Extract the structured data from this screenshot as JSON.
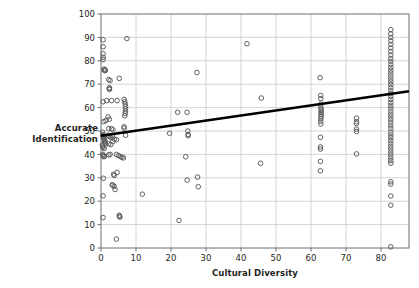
{
  "chart_data": {
    "type": "scatter",
    "title": "",
    "xlabel": "Cultural Diversity",
    "ylabel": "Accurate\nIdentification",
    "xlim": [
      0,
      88
    ],
    "ylim": [
      0,
      100
    ],
    "xticks": [
      0,
      10,
      20,
      30,
      40,
      50,
      60,
      70,
      80
    ],
    "yticks": [
      0,
      10,
      20,
      30,
      40,
      50,
      60,
      70,
      80,
      90,
      100
    ],
    "xtick_labels": [
      "0",
      "10",
      "20",
      "30",
      "40",
      "50",
      "60",
      "70",
      "80"
    ],
    "ytick_labels": [
      "0",
      "10",
      "20",
      "30",
      "40",
      "50",
      "60",
      "70",
      "80",
      "90",
      "100"
    ],
    "grid": true,
    "grid_color": "#c9c9c9",
    "legend": "none",
    "marker": "open-circle",
    "marker_edge_color": "#58595b",
    "marker_face_color": "none",
    "trendline": {
      "type": "linear",
      "color": "#000000",
      "width": 2.6,
      "x_start": 0,
      "y_start": 48,
      "x_end": 88,
      "y_end": 67
    },
    "points": [
      [
        0.6,
        89
      ],
      [
        0.6,
        86
      ],
      [
        0.6,
        83
      ],
      [
        0.6,
        81.5
      ],
      [
        0.6,
        80.5
      ],
      [
        0.9,
        76.5
      ],
      [
        0.9,
        76
      ],
      [
        1.2,
        76
      ],
      [
        1.2,
        75.8
      ],
      [
        0.6,
        62.5
      ],
      [
        1.6,
        63
      ],
      [
        3.0,
        63
      ],
      [
        4.6,
        63
      ],
      [
        2.2,
        72
      ],
      [
        2.6,
        71.5
      ],
      [
        5.2,
        72.5
      ],
      [
        2.4,
        68.5
      ],
      [
        2.4,
        68
      ],
      [
        2.4,
        67.8
      ],
      [
        0.8,
        54
      ],
      [
        1.4,
        54.5
      ],
      [
        2.0,
        56
      ],
      [
        2.4,
        55
      ],
      [
        2.2,
        51
      ],
      [
        3.0,
        51
      ],
      [
        3.4,
        50.5
      ],
      [
        0.5,
        49.5
      ],
      [
        0.5,
        48.5
      ],
      [
        0.6,
        48
      ],
      [
        0.7,
        47.5
      ],
      [
        0.8,
        47
      ],
      [
        0.9,
        46.5
      ],
      [
        1.0,
        46
      ],
      [
        1.1,
        45.5
      ],
      [
        1.2,
        45
      ],
      [
        1.3,
        44.5
      ],
      [
        0.4,
        44
      ],
      [
        0.5,
        43.5
      ],
      [
        0.6,
        43
      ],
      [
        0.9,
        42.5
      ],
      [
        2.1,
        48.2
      ],
      [
        2.4,
        47.6
      ],
      [
        2.8,
        47.2
      ],
      [
        3.3,
        47.8
      ],
      [
        2.2,
        44.5
      ],
      [
        2.8,
        44.2
      ],
      [
        3.4,
        45.5
      ],
      [
        3.8,
        46.5
      ],
      [
        4.4,
        46.3
      ],
      [
        0.5,
        40
      ],
      [
        0.6,
        39.5
      ],
      [
        0.8,
        39
      ],
      [
        1.0,
        39.2
      ],
      [
        2.2,
        39.8
      ],
      [
        2.6,
        40
      ],
      [
        4.4,
        40
      ],
      [
        5.0,
        39.5
      ],
      [
        5.6,
        39
      ],
      [
        6.0,
        38.8
      ],
      [
        6.4,
        38.5
      ],
      [
        3.6,
        31.5
      ],
      [
        3.8,
        31
      ],
      [
        4.6,
        32.3
      ],
      [
        3.2,
        27
      ],
      [
        3.4,
        26.8
      ],
      [
        3.8,
        26.3
      ],
      [
        4.0,
        25.0
      ],
      [
        0.7,
        29.8
      ],
      [
        0.6,
        22.3
      ],
      [
        0.6,
        13.0
      ],
      [
        5.2,
        14.0
      ],
      [
        5.3,
        13.5
      ],
      [
        5.4,
        13.2
      ],
      [
        4.4,
        3.8
      ],
      [
        6.6,
        63.5
      ],
      [
        6.8,
        62.5
      ],
      [
        6.9,
        61.5
      ],
      [
        7.0,
        60.5
      ],
      [
        7.0,
        59.5
      ],
      [
        7.0,
        58.5
      ],
      [
        6.9,
        57.5
      ],
      [
        6.8,
        56.5
      ],
      [
        6.6,
        51.8
      ],
      [
        6.6,
        51.2
      ],
      [
        7.4,
        89.5
      ],
      [
        7.0,
        48.2
      ],
      [
        11.8,
        23.0
      ],
      [
        19.6,
        49.0
      ],
      [
        21.9,
        58.0
      ],
      [
        24.6,
        58.0
      ],
      [
        22.3,
        11.8
      ],
      [
        24.8,
        50.0
      ],
      [
        24.9,
        48.5
      ],
      [
        24.9,
        48.0
      ],
      [
        24.2,
        39.0
      ],
      [
        24.6,
        29.0
      ],
      [
        27.6,
        30.3
      ],
      [
        27.8,
        26.2
      ],
      [
        27.4,
        75.0
      ],
      [
        41.7,
        87.3
      ],
      [
        45.8,
        64.1
      ],
      [
        45.6,
        36.2
      ],
      [
        62.6,
        72.8
      ],
      [
        62.8,
        65.2
      ],
      [
        62.8,
        63.8
      ],
      [
        62.8,
        61.5
      ],
      [
        62.8,
        60.3
      ],
      [
        62.9,
        59.3
      ],
      [
        62.9,
        58.5
      ],
      [
        62.9,
        57.8
      ],
      [
        62.9,
        57.0
      ],
      [
        62.9,
        56.2
      ],
      [
        62.8,
        55.3
      ],
      [
        62.8,
        54.2
      ],
      [
        62.8,
        53.0
      ],
      [
        62.7,
        47.3
      ],
      [
        62.7,
        43.2
      ],
      [
        62.7,
        42.3
      ],
      [
        62.7,
        37.0
      ],
      [
        62.7,
        33.0
      ],
      [
        73.0,
        55.5
      ],
      [
        73.0,
        54.0
      ],
      [
        73.0,
        53.2
      ],
      [
        73.0,
        50.8
      ],
      [
        73.0,
        49.8
      ],
      [
        73.0,
        40.2
      ],
      [
        82.8,
        93.3
      ],
      [
        82.8,
        91.5
      ],
      [
        82.8,
        90.0
      ],
      [
        82.8,
        88.5
      ],
      [
        82.8,
        87.0
      ],
      [
        82.8,
        85.5
      ],
      [
        82.8,
        84.0
      ],
      [
        82.8,
        82.5
      ],
      [
        82.8,
        81.0
      ],
      [
        82.8,
        79.8
      ],
      [
        82.8,
        78.5
      ],
      [
        82.8,
        77.2
      ],
      [
        82.8,
        76.0
      ],
      [
        82.8,
        74.8
      ],
      [
        82.8,
        73.5
      ],
      [
        82.8,
        72.2
      ],
      [
        82.8,
        71.0
      ],
      [
        82.8,
        69.8
      ],
      [
        82.8,
        68.5
      ],
      [
        82.8,
        67.2
      ],
      [
        82.8,
        66.0
      ],
      [
        82.8,
        64.8
      ],
      [
        82.8,
        63.5
      ],
      [
        82.8,
        62.2
      ],
      [
        82.8,
        61.0
      ],
      [
        82.8,
        59.8
      ],
      [
        82.8,
        58.5
      ],
      [
        82.8,
        57.2
      ],
      [
        82.8,
        56.0
      ],
      [
        82.8,
        54.8
      ],
      [
        82.8,
        53.5
      ],
      [
        82.8,
        52.2
      ],
      [
        82.8,
        51.0
      ],
      [
        82.8,
        49.5
      ],
      [
        82.8,
        48.3
      ],
      [
        82.8,
        47.2
      ],
      [
        82.8,
        46.0
      ],
      [
        82.8,
        44.8
      ],
      [
        82.8,
        43.5
      ],
      [
        82.8,
        42.3
      ],
      [
        82.8,
        41.0
      ],
      [
        82.8,
        39.8
      ],
      [
        82.8,
        38.5
      ],
      [
        82.8,
        37.3
      ],
      [
        82.8,
        36.2
      ],
      [
        82.8,
        28.3
      ],
      [
        82.8,
        27.3
      ],
      [
        82.8,
        22.2
      ],
      [
        82.8,
        18.3
      ],
      [
        82.8,
        0.5
      ]
    ]
  }
}
